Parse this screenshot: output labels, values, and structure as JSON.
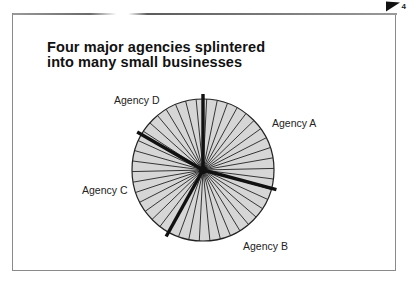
{
  "page": {
    "number": "4"
  },
  "chart_data": {
    "type": "pie",
    "title": "Four major agencies splintered into many small businesses",
    "title_lines": [
      "Four major agencies splintered",
      "into many small businesses"
    ],
    "categories": [
      "Agency A",
      "Agency B",
      "Agency C",
      "Agency D"
    ],
    "values": [
      29,
      29,
      25,
      17
    ],
    "start_angles_deg": [
      0,
      105,
      209,
      300
    ],
    "thin_slice_count": 42,
    "fill_color": "#d6d6d6",
    "line_color": "#222222",
    "major_divider_color": "#111111",
    "legend": "direct labels",
    "grid": false
  },
  "labels": {
    "a": "Agency A",
    "b": "Agency B",
    "c": "Agency C",
    "d": "Agency D"
  }
}
